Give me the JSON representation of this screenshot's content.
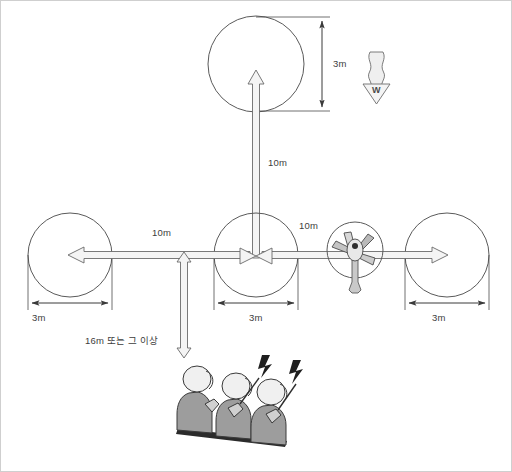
{
  "diagram": {
    "border_color": "#cfcfcf",
    "line_color": "#4b4b4b",
    "arrow_fill": "#f2f2f2",
    "figure_fill": "#9d9d9d",
    "figure_head_fill": "#f0f0f0"
  },
  "labels": {
    "top_circle_diameter": "3m",
    "left_circle_diameter": "3m",
    "center_circle_diameter": "3m",
    "right_circle_diameter": "3m",
    "vertical_distance_top": "10m",
    "horizontal_distance_left": "10m",
    "horizontal_distance_right": "10m",
    "clearance": "16m 또는 그 이상",
    "wind_marker": "W"
  },
  "elements": {
    "top_circle": "target-circle-top",
    "left_circle": "target-circle-left",
    "center_circle": "target-circle-center",
    "right_circle": "target-circle-right",
    "fan": "pedestal-fan",
    "wind_arrow": "wind-direction-arrow",
    "observers": "observer-group",
    "observer_count": 3
  }
}
